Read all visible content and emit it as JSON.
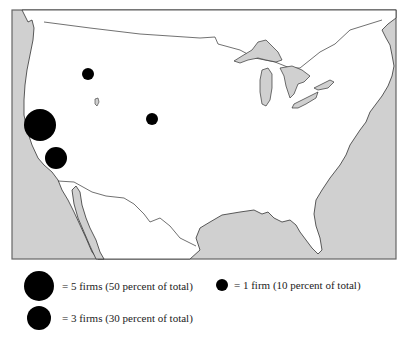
{
  "map": {
    "title": "",
    "region": "United States (with southern Canada and northern Mexico)",
    "colors": {
      "ocean": "#d0d0d0",
      "land": "#ffffff",
      "outline": "#333333",
      "marker": "#000000",
      "frame": "#666666"
    },
    "markers": [
      {
        "label": "5 firms",
        "cx": 40,
        "cy": 125,
        "r": 16,
        "firms": 5
      },
      {
        "label": "3 firms",
        "cx": 56,
        "cy": 158,
        "r": 11,
        "firms": 3
      },
      {
        "label": "1 firm",
        "cx": 88,
        "cy": 74,
        "r": 6,
        "firms": 1
      },
      {
        "label": "1 firm",
        "cx": 152,
        "cy": 119,
        "r": 6,
        "firms": 1
      }
    ]
  },
  "legend": {
    "items": [
      {
        "text": "= 5 firms (50 percent of total)",
        "firms": 5,
        "percent": 50
      },
      {
        "text": "= 1 firm (10 percent of total)",
        "firms": 1,
        "percent": 10
      },
      {
        "text": "= 3 firms (30 percent of total)",
        "firms": 3,
        "percent": 30
      }
    ]
  }
}
